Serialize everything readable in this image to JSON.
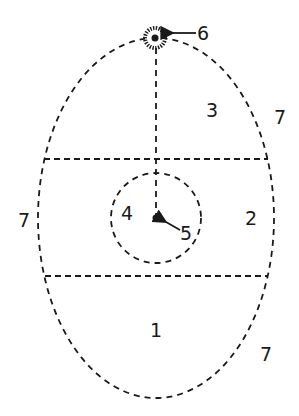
{
  "diagram": {
    "labels": {
      "one": "1",
      "two": "2",
      "three": "3",
      "four": "4",
      "five": "5",
      "six": "6",
      "seven_right_top": "7",
      "seven_left": "7",
      "seven_right_bottom": "7"
    },
    "colors": {
      "stroke": "#1a1a1a",
      "background": "#ffffff"
    },
    "elements": [
      {
        "id": "outer-ellipse",
        "style": "dashed"
      },
      {
        "id": "upper-horizontal-line",
        "style": "dashed"
      },
      {
        "id": "lower-horizontal-line",
        "style": "dashed"
      },
      {
        "id": "inner-circle",
        "style": "dashed"
      },
      {
        "id": "vertical-line",
        "style": "dashed"
      },
      {
        "id": "center-dot",
        "style": "filled"
      },
      {
        "id": "top-radiant-point",
        "style": "sun-like"
      }
    ]
  }
}
